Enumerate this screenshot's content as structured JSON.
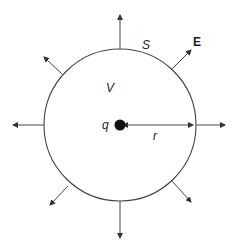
{
  "diagram": {
    "labels": {
      "surface": "S",
      "field": "E",
      "volume": "V",
      "charge": "q",
      "radius": "r"
    },
    "colors": {
      "line": "#444444",
      "charge": "#111111"
    }
  }
}
